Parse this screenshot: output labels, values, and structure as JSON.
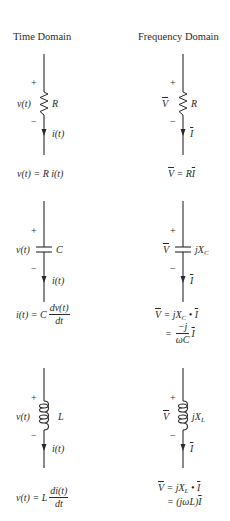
{
  "headers": {
    "time": "Time Domain",
    "frequency": "Frequency Domain"
  },
  "resistor": {
    "time": {
      "plus": "+",
      "minus": "−",
      "voltage": "v(t)",
      "element": "R",
      "current": "i(t)",
      "equation": "v(t) = R i(t)"
    },
    "frequency": {
      "plus": "+",
      "minus": "−",
      "voltage": "V",
      "element": "R",
      "current": "I",
      "equation_lhs": "V",
      "equation_eq": " = R",
      "equation_rhs": "I"
    }
  },
  "capacitor": {
    "time": {
      "plus": "+",
      "minus": "−",
      "voltage": "v(t)",
      "element": "C",
      "current": "i(t)",
      "equation_lhs": "i(t) = C",
      "equation_num": "dv(t)",
      "equation_den": "dt"
    },
    "frequency": {
      "plus": "+",
      "minus": "−",
      "voltage": "V",
      "element": "jX",
      "element_sub": "C",
      "current": "I",
      "equation1_lhs": "V",
      "equation1_mid": " = jX",
      "equation1_sub": "C",
      "equation1_dot": " • ",
      "equation1_rhs": "I",
      "equation2_eq": "=",
      "equation2_num": "−j",
      "equation2_den": "ωC",
      "equation2_rhs": "I"
    }
  },
  "inductor": {
    "time": {
      "plus": "+",
      "minus": "−",
      "voltage": "v(t)",
      "element": "L",
      "current": "i(t)",
      "equation_lhs": "v(t) = L",
      "equation_num": "di(t)",
      "equation_den": "dt"
    },
    "frequency": {
      "plus": "+",
      "minus": "−",
      "voltage": "V",
      "element": "jX",
      "element_sub": "L",
      "current": "I",
      "equation1_lhs": "V",
      "equation1_mid": " = jX",
      "equation1_sub": "L",
      "equation1_dot": " • ",
      "equation1_rhs": "I",
      "equation2_eq": "= (jωL)",
      "equation2_rhs": "I"
    }
  }
}
